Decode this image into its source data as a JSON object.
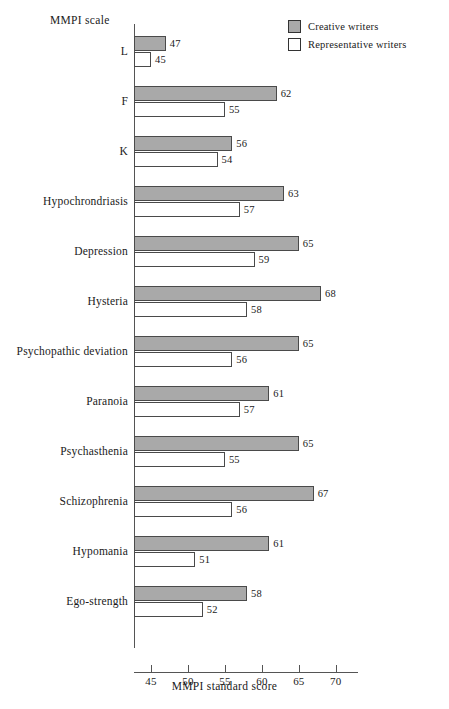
{
  "chart_data": {
    "type": "bar",
    "orientation": "horizontal",
    "title": "",
    "xlabel": "MMPI standard score",
    "ylabel": "MMPI scale",
    "xlim": [
      42.7,
      73.0
    ],
    "xticks": [
      45,
      50,
      55,
      60,
      65,
      70
    ],
    "xtick_labels": [
      "45",
      "50",
      "55",
      "60",
      "65",
      "70"
    ],
    "grid": false,
    "legend_position": "top-right",
    "categories": [
      "L",
      "F",
      "K",
      "Hypochrondriasis",
      "Depression",
      "Hysteria",
      "Psychopathic deviation",
      "Paranoia",
      "Psychasthenia",
      "Schizophrenia",
      "Hypomania",
      "Ego-strength"
    ],
    "series": [
      {
        "name": "Creative writers",
        "color": "#a9a9a9",
        "values": [
          47,
          62,
          56,
          63,
          65,
          68,
          65,
          61,
          65,
          67,
          61,
          58
        ]
      },
      {
        "name": "Representative writers",
        "color": "#ffffff",
        "values": [
          45,
          55,
          54,
          57,
          59,
          58,
          56,
          57,
          55,
          56,
          51,
          52
        ]
      }
    ]
  },
  "legend": {
    "entries": [
      {
        "label": "Creative writers",
        "swatch": "filled"
      },
      {
        "label": "Representative writers",
        "swatch": "hollow"
      }
    ]
  },
  "caption": ""
}
